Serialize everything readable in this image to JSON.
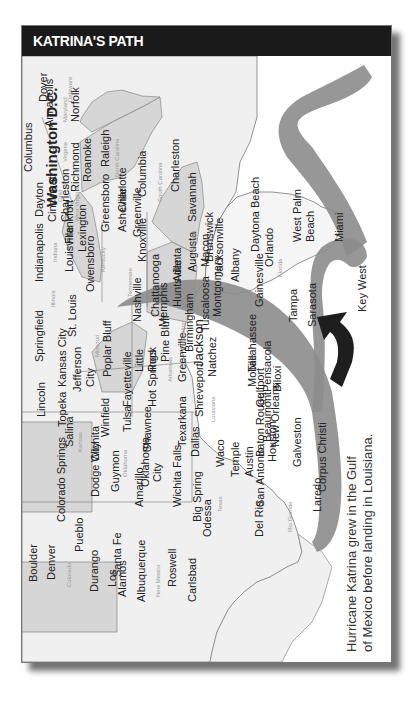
{
  "title": "KATRINA'S PATH",
  "caption": {
    "line1": "Hurricane Katrina grew in the Gulf",
    "line2": "of Mexico before landing in Louisiana."
  },
  "colors": {
    "title_bar": "#1a1a1a",
    "path_band": "#8c8c8c",
    "arrow": "#1e1e1e",
    "state_light": "#efefef",
    "state_shaded": "#d6d6d6"
  },
  "states": [
    "Delaware",
    "Maryland",
    "Virginia",
    "North Carolina",
    "South Carolina",
    "Georgia",
    "Florida",
    "West Virginia",
    "Ohio",
    "Kentucky",
    "Tennessee",
    "Alabama",
    "Indiana",
    "Illinois",
    "Missouri",
    "Arkansas",
    "Mississippi",
    "Louisiana",
    "Kansas",
    "Oklahoma",
    "Texas",
    "Colorado",
    "New Mexico"
  ],
  "cities": [
    "Dover",
    "Annapolis",
    "Baltimore",
    "Norfolk",
    "Washington D.C.",
    "Charleston",
    "Richmond",
    "Roanoke",
    "Raleigh",
    "Greensboro",
    "Charlotte",
    "Asheville",
    "Columbia",
    "Greenville",
    "Charleston",
    "Savannah",
    "Brunswick",
    "Jacksonville",
    "Daytona Beach",
    "Orlando",
    "West Palm Beach",
    "Miami",
    "Key West",
    "Tampa",
    "Sarasota",
    "Gainesville",
    "Tallahassee",
    "Pensacola",
    "Albany",
    "Macon",
    "Augusta",
    "Atlanta",
    "Montgomery",
    "Tuscaloosa",
    "Birmingham",
    "Huntsville",
    "Chattanooga",
    "Knoxville",
    "Nashville",
    "Memphis",
    "Columbus",
    "Dayton",
    "Cincinnati",
    "Frankfort",
    "Lexington",
    "Louisville",
    "Owensboro",
    "Indianapolis",
    "Springfield",
    "St. Louis",
    "Kansas City",
    "Jefferson City",
    "Poplar Bluff",
    "Fayetteville",
    "Little Rock",
    "Pine Bluff",
    "Hot Springs",
    "Greenville",
    "Jackson",
    "Natchez",
    "Mobile",
    "Biloxi",
    "Gulfport",
    "New Orleans",
    "Baton Rouge",
    "Shreveport",
    "Texarkana",
    "Dallas",
    "Tulsa",
    "Shawnee",
    "Oklahoma City",
    "Topeka",
    "Salina",
    "Wichita",
    "Winfield",
    "Lincoln",
    "Guymon",
    "Dodge City",
    "Amarillo",
    "Wichita Falls",
    "Waco",
    "Temple",
    "Austin",
    "Houston",
    "Beaumont",
    "Galveston",
    "Corpus Christi",
    "San Antonio",
    "Laredo",
    "Del Rio",
    "Big Spring",
    "Odessa",
    "Colorado Springs",
    "Pueblo",
    "Boulder",
    "Denver",
    "Durango",
    "Santa Fe",
    "Los Alamos",
    "Albuquerque",
    "Roswell",
    "Carlsbad"
  ],
  "labels": {
    "dover": "Dover",
    "annapolis": "Annapolis",
    "norfolk": "Norfolk",
    "dc": "Washington D.C.",
    "charleston_wv": "Charleston",
    "richmond": "Richmond",
    "roanoke": "Roanoke",
    "raleigh": "Raleigh",
    "greensboro": "Greensboro",
    "charlotte": "Charlotte",
    "asheville": "Asheville",
    "columbia": "Columbia",
    "greenville_sc": "Greenville",
    "charleston_sc": "Charleston",
    "savannah": "Savannah",
    "brunswick": "Brunswick",
    "jacksonville": "Jacksonville",
    "daytona": "Daytona Beach",
    "orlando": "Orlando",
    "wpb1": "West Palm",
    "wpb2": "Beach",
    "miami": "Miami",
    "keywest": "Key West",
    "tampa": "Tampa",
    "sarasota": "Sarasota",
    "gainesville": "Gainesville",
    "tallahassee": "Tallahassee",
    "pensacola": "Pensacola",
    "albany": "Albany",
    "macon": "Macon",
    "augusta": "Augusta",
    "atlanta": "Atlanta",
    "montgomery": "Montgomery",
    "tuscaloosa": "Tuscaloosa",
    "birmingham": "Birmingham",
    "huntsville": "Huntsville",
    "chattanooga": "Chattanooga",
    "knoxville": "Knoxville",
    "nashville": "Nashville",
    "memphis": "Memphis",
    "columbus": "Columbus",
    "dayton": "Dayton",
    "cincinnati": "Cincinnati",
    "frankfort": "Frankfort",
    "lexington": "Lexington",
    "louisville": "Louisville",
    "owensboro": "Owensboro",
    "indianapolis": "Indianapolis",
    "springfield": "Springfield",
    "stlouis": "St. Louis",
    "kc": "Kansas City",
    "jc1": "Jefferson",
    "jc2": "City",
    "poplar": "Poplar Bluff",
    "fayetteville": "Fayetteville",
    "lr1": "Little",
    "lr2": "Rock",
    "pinebluff": "Pine Bluff",
    "hotsprings": "Hot Springs",
    "greenville_ms": "Greenville",
    "jackson": "Jackson",
    "natchez": "Natchez",
    "mobile": "Mobile",
    "biloxi": "Biloxi",
    "gulfport": "Gulfport",
    "neworleans": "New Orleans",
    "batonrouge": "Baton Rouge",
    "shreveport": "Shreveport",
    "texarkana": "Texarkana",
    "dallas": "Dallas",
    "tulsa": "Tulsa",
    "shawnee": "Shawnee",
    "okc1": "Oklahoma",
    "okc2": "City",
    "topeka": "Topeka",
    "salina": "Salina",
    "wichita": "Wichita",
    "winfield": "Winfield",
    "lincoln": "Lincoln",
    "guymon": "Guymon",
    "dodge": "Dodge City",
    "amarillo": "Amarillo",
    "wfalls": "Wichita Falls",
    "waco": "Waco",
    "temple": "Temple",
    "austin": "Austin",
    "houston": "Houston",
    "beaumont": "Beaumont",
    "galveston": "Galveston",
    "corpus": "Corpus Christi",
    "sanantonio": "San Antonio",
    "laredo": "Laredo",
    "delrio": "Del Rio",
    "bigspring": "Big Spring",
    "odessa": "Odessa",
    "cosprings": "Colorado Springs",
    "pueblo": "Pueblo",
    "boulder": "Boulder",
    "denver": "Denver",
    "durango": "Durango",
    "santafe": "Santa Fe",
    "losalamos1": "Los",
    "losalamos2": "Alamos",
    "albuquerque": "Albuquerque",
    "roswell": "Roswell",
    "carlsbad": "Carlsbad",
    "st_virginia": "Virginia",
    "st_nc": "North Carolina",
    "st_sc": "South Carolina",
    "st_ga": "Georgia",
    "st_fl": "Florida",
    "st_wv": "West Virginia",
    "st_oh": "Ohio",
    "st_ky": "Kentucky",
    "st_tn": "Tennessee",
    "st_al": "Alabama",
    "st_in": "Indiana",
    "st_il": "Illinois",
    "st_mo": "Missouri",
    "st_ar": "Arkansas",
    "st_ms": "Mississippi",
    "st_la": "Louisiana",
    "st_ks": "Kansas",
    "st_ok": "Oklahoma",
    "st_tx": "Texas",
    "st_co": "Colorado",
    "st_nm": "New Mexico",
    "st_md": "Maryland",
    "st_de": "Delaware",
    "rio": "Rio Grande"
  }
}
